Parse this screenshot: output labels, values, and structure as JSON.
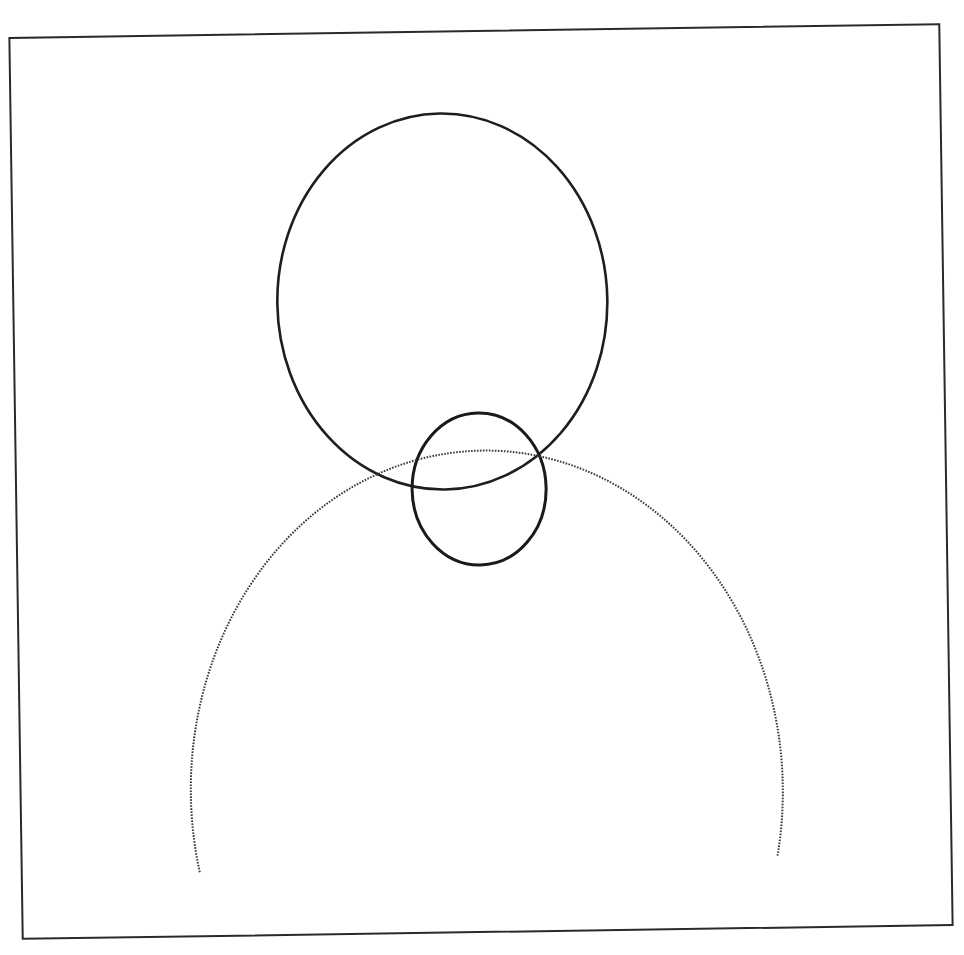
{
  "figure": {
    "frame": {
      "x1": 16,
      "y1": 31,
      "x2": 946,
      "y2": 932,
      "rotation_deg": -0.85,
      "stroke": "#2a2a2a"
    },
    "shapes": [
      {
        "id": "upper-ellipse",
        "cx": 445,
        "cy": 301,
        "rx": 165,
        "ry": 188,
        "style": "solid",
        "stroke": "#1e1e1e",
        "width": 2.6
      },
      {
        "id": "small-ellipse",
        "cx": 479,
        "cy": 489,
        "rx": 67,
        "ry": 76,
        "style": "solid",
        "stroke": "#1a1a1a",
        "width": 3
      },
      {
        "id": "large-arc",
        "cx": 482,
        "cy": 790,
        "rx": 296,
        "ry": 340,
        "style": "dotted",
        "stroke": "#3a3a3a",
        "width": 2,
        "start": [
          194,
          868
        ],
        "end": [
          772,
          860
        ]
      }
    ]
  }
}
